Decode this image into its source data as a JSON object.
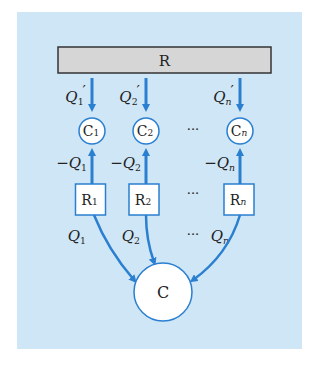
{
  "colors": {
    "panel": "#cfe6f6",
    "arrow": "#2a7fd0",
    "node_border": "#2a7fd0",
    "node_fill": "#ffffff",
    "bar_fill": "#d6d6d6",
    "bar_border": "#333333",
    "text": "#222222"
  },
  "reservoir": {
    "label": "R"
  },
  "columns": [
    {
      "top_label": "Q",
      "top_sub": "1",
      "top_prime": "′",
      "node": "C",
      "node_sub": "1",
      "mid_label": "−Q",
      "mid_sub": "1",
      "box": "R",
      "box_sub": "1",
      "bottom_label": "Q",
      "bottom_sub": "1"
    },
    {
      "top_label": "Q",
      "top_sub": "2",
      "top_prime": "′",
      "node": "C",
      "node_sub": "2",
      "mid_label": "−Q",
      "mid_sub": "2",
      "box": "R",
      "box_sub": "2",
      "bottom_label": "Q",
      "bottom_sub": "2"
    },
    {
      "top_label": "Q",
      "top_sub": "n",
      "top_prime": "′",
      "node": "C",
      "node_sub": "n",
      "mid_label": "−Q",
      "mid_sub": "n",
      "box": "R",
      "box_sub": "n",
      "bottom_label": "Q",
      "bottom_sub": "n"
    }
  ],
  "ellipsis": "···",
  "sink": {
    "label": "C"
  }
}
